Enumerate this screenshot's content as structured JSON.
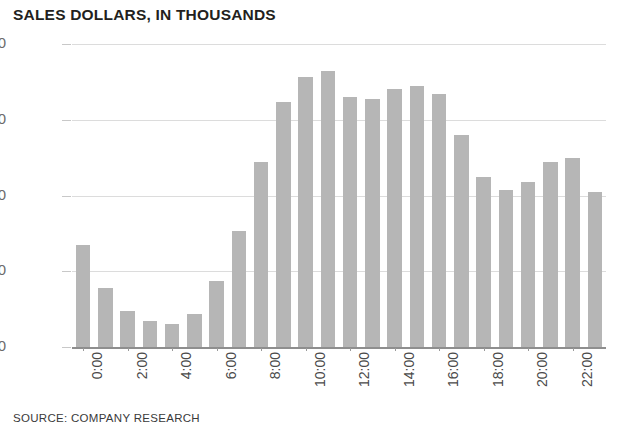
{
  "chart_data": {
    "type": "bar",
    "title": "SALES DOLLARS, IN THOUSANDS",
    "xlabel": "",
    "ylabel": "",
    "ylim": [
      0,
      800
    ],
    "yticks": [
      0,
      200,
      400,
      600,
      800
    ],
    "ytick_labels": [
      "0",
      "200",
      "400",
      "600",
      "$800"
    ],
    "grid": true,
    "legend": "none",
    "categories": [
      "0:00",
      "1:00",
      "2:00",
      "3:00",
      "4:00",
      "5:00",
      "6:00",
      "7:00",
      "8:00",
      "9:00",
      "10:00",
      "11:00",
      "12:00",
      "13:00",
      "14:00",
      "15:00",
      "16:00",
      "17:00",
      "18:00",
      "19:00",
      "20:00",
      "21:00",
      "22:00",
      "23:00"
    ],
    "xtick_labels": [
      "0:00",
      "2:00",
      "4:00",
      "6:00",
      "8:00",
      "10:00",
      "12:00",
      "14:00",
      "16:00",
      "18:00",
      "20:00",
      "22:00"
    ],
    "values": [
      270,
      155,
      95,
      68,
      60,
      88,
      175,
      305,
      488,
      648,
      712,
      728,
      660,
      655,
      680,
      688,
      668,
      560,
      450,
      415,
      435,
      488,
      500,
      408
    ],
    "bar_color": "#b6b6b6",
    "gridline_color": "#dcdcdc",
    "axis_color": "#8e8e8e"
  },
  "footer": {
    "source": "SOURCE: COMPANY RESEARCH"
  }
}
